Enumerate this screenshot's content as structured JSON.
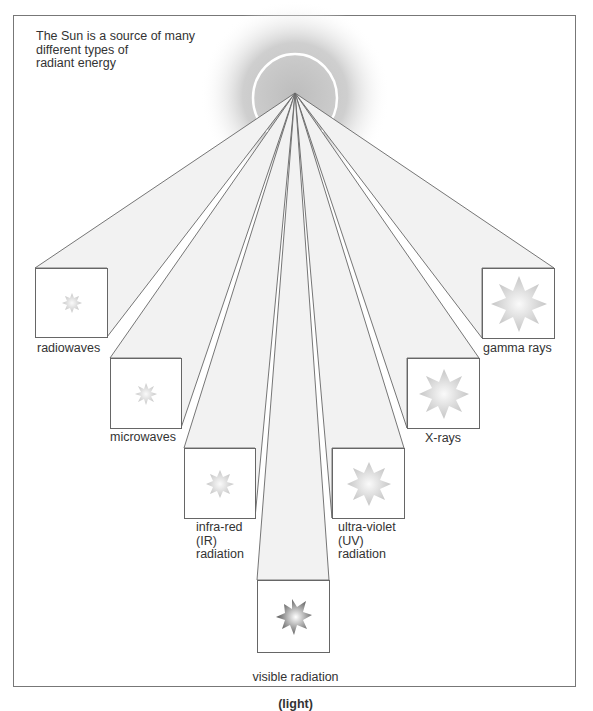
{
  "diagram": {
    "caption": "The Sun is a source of many\ndifferent types of\nradiant energy",
    "source_label": "Sun",
    "colors": {
      "beam_fill": "#f1f1f1",
      "line": "#666666",
      "glow": "#c8c8c8",
      "text": "#333333"
    },
    "boxes": [
      {
        "id": "radiowaves",
        "label": "radiowaves",
        "star_size": 20,
        "star_icon": "star-burst-icon"
      },
      {
        "id": "microwaves",
        "label": "microwaves",
        "star_size": 22,
        "star_icon": "star-burst-icon"
      },
      {
        "id": "infrared",
        "label": "infra-red\n(IR)\nradiation",
        "star_size": 28,
        "star_icon": "star-burst-icon"
      },
      {
        "id": "visible",
        "label": "visible radiation",
        "label_bold": "(light)",
        "star_size": 36,
        "star_icon": "star-burst-icon"
      },
      {
        "id": "ultraviolet",
        "label": "ultra-violet\n(UV)\nradiation",
        "star_size": 44,
        "star_icon": "star-burst-icon"
      },
      {
        "id": "xrays",
        "label": "X-rays",
        "star_size": 50,
        "star_icon": "star-burst-icon"
      },
      {
        "id": "gamma",
        "label": "gamma rays",
        "star_size": 56,
        "star_icon": "star-burst-icon"
      }
    ]
  }
}
